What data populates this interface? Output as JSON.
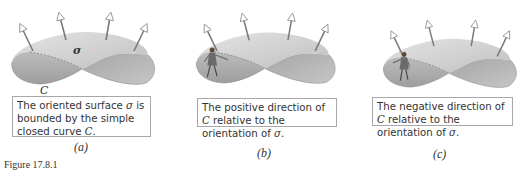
{
  "figure": {
    "label": "Figure 17.8.1",
    "colors": {
      "surface_light": "#d9d9d9",
      "surface_dark": "#a9a9a9",
      "arrow": "#777777",
      "box_border": "#a8a8a8",
      "text": "#333333"
    },
    "panels": [
      {
        "id": "a",
        "sub_label": "(a)",
        "surface_label": "σ",
        "curve_label": "C",
        "caption_parts": [
          "The oriented surface ",
          "σ",
          " is bounded by the simple closed curve ",
          "C",
          "."
        ],
        "has_walker": false
      },
      {
        "id": "b",
        "sub_label": "(b)",
        "caption_parts": [
          "The positive direction of ",
          "C",
          " relative to the orientation of ",
          "σ",
          "."
        ],
        "has_walker": true,
        "walker_facing": "right"
      },
      {
        "id": "c",
        "sub_label": "(c)",
        "caption_parts": [
          "The negative direction of ",
          "C",
          " relative to the orientation of ",
          "σ",
          "."
        ],
        "has_walker": true,
        "walker_facing": "left"
      }
    ]
  }
}
